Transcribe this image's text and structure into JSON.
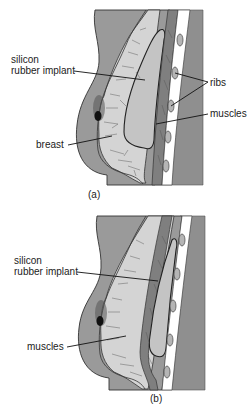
{
  "figure": {
    "panels": [
      {
        "id": "a",
        "caption": "(a)",
        "labels": {
          "implant_line1": "silicon",
          "implant_line2": "rubber implant",
          "ribs": "ribs",
          "muscles": "muscles",
          "breast": "breast"
        },
        "implant_placement": "behind breast tissue, in front of muscles"
      },
      {
        "id": "b",
        "caption": "(b)",
        "labels": {
          "implant_line1": "silicon",
          "implant_line2": "rubber implant",
          "muscles": "muscles"
        },
        "implant_placement": "behind muscles, in front of ribs"
      }
    ]
  },
  "colors": {
    "body": "#9a9a9a",
    "tissue": "#d4d4d4",
    "implant": "#c4c4c4",
    "muscle": "#7f7f7f",
    "chest_wall": "#ffffff",
    "rib": "#b5b5b5"
  }
}
